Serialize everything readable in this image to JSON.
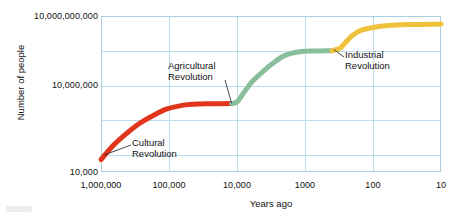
{
  "chart_data": {
    "type": "line",
    "title": "",
    "subtitle": "",
    "xlabel": "Years ago",
    "ylabel": "Number of people",
    "x_scale": "log-reversed",
    "y_scale": "log",
    "xlim": [
      1000000,
      10
    ],
    "ylim": [
      10000,
      10000000000
    ],
    "x_tick_labels": [
      "1,000,000",
      "100,000",
      "10,000",
      "1000",
      "100",
      "10"
    ],
    "x_tick_values": [
      1000000,
      100000,
      10000,
      1000,
      100,
      10
    ],
    "y_tick_labels": [
      "10,000,000,000",
      "10,000,000",
      "10,000"
    ],
    "y_tick_values": [
      10000000000,
      10000000,
      10000
    ],
    "grid": true,
    "legend_position": "none",
    "series": [
      {
        "name": "Cultural Revolution",
        "color": "#e2361c",
        "points": [
          {
            "x": 1000000,
            "y": 30000
          },
          {
            "x": 700000,
            "y": 90000
          },
          {
            "x": 450000,
            "y": 260000
          },
          {
            "x": 280000,
            "y": 700000
          },
          {
            "x": 170000,
            "y": 1500000
          },
          {
            "x": 110000,
            "y": 2600000
          },
          {
            "x": 70000,
            "y": 3500000
          },
          {
            "x": 45000,
            "y": 4000000
          },
          {
            "x": 25000,
            "y": 4200000
          },
          {
            "x": 12000,
            "y": 4300000
          }
        ]
      },
      {
        "name": "Agricultural Revolution",
        "color": "#89be9d",
        "points": [
          {
            "x": 12000,
            "y": 4300000
          },
          {
            "x": 10000,
            "y": 5000000
          },
          {
            "x": 8000,
            "y": 11000000
          },
          {
            "x": 6000,
            "y": 30000000
          },
          {
            "x": 4000,
            "y": 80000000
          },
          {
            "x": 3000,
            "y": 150000000
          },
          {
            "x": 2000,
            "y": 300000000
          },
          {
            "x": 1200,
            "y": 420000000
          },
          {
            "x": 700,
            "y": 450000000
          },
          {
            "x": 400,
            "y": 460000000
          }
        ]
      },
      {
        "name": "Industrial Revolution",
        "color": "#efc23c",
        "points": [
          {
            "x": 400,
            "y": 460000000
          },
          {
            "x": 300,
            "y": 600000000
          },
          {
            "x": 250,
            "y": 1000000000
          },
          {
            "x": 200,
            "y": 1800000000
          },
          {
            "x": 150,
            "y": 2800000000
          },
          {
            "x": 100,
            "y": 3600000000
          },
          {
            "x": 60,
            "y": 4300000000
          },
          {
            "x": 30,
            "y": 4700000000
          },
          {
            "x": 10,
            "y": 4900000000
          }
        ]
      }
    ],
    "annotations": [
      {
        "id": "cultural",
        "line1": "Cultural",
        "line2": "Revolution",
        "points_to_x": 900000,
        "points_to_y": 45000
      },
      {
        "id": "agricultural",
        "line1": "Agricultural",
        "line2": "Revolution",
        "points_to_x": 12000,
        "points_to_y": 4400000
      },
      {
        "id": "industrial",
        "line1": "Industrial",
        "line2": "Revolution",
        "points_to_x": 380,
        "points_to_y": 520000000
      }
    ]
  },
  "axes": {
    "y_title": "Number of people",
    "x_title": "Years ago",
    "y_ticks": [
      {
        "label": "10,000,000,000",
        "top": 11
      },
      {
        "label": "10,000,000",
        "top": 80
      },
      {
        "label": "10,000",
        "top": 167
      }
    ],
    "x_ticks": [
      {
        "label": "1,000,000",
        "center": 101
      },
      {
        "label": "100,000",
        "center": 169
      },
      {
        "label": "10,000",
        "center": 237
      },
      {
        "label": "1000",
        "center": 305
      },
      {
        "label": "100",
        "center": 373
      },
      {
        "label": "10",
        "center": 441
      }
    ]
  },
  "style": {
    "grid_color": "#bcdcea",
    "axis_color": "#a9cfe0",
    "text_color": "#111111",
    "background": "#ffffff",
    "curve_cultural_color": "#e2361c",
    "curve_agricultural_color": "#89be9d",
    "curve_industrial_color": "#efc23c"
  }
}
